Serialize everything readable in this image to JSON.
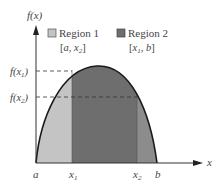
{
  "diagram": {
    "y_axis_label": "f(x)",
    "x_axis_label": "x",
    "legend": [
      {
        "name": "Region 1",
        "interval": "[a, x2]",
        "interval_display_a": "[",
        "interval_var1": "a",
        "interval_sep": ", ",
        "interval_var2": "x",
        "interval_sub2": "2",
        "interval_close": "]",
        "color": "#c0c0c0"
      },
      {
        "name": "Region 2",
        "interval": "[x1, b]",
        "interval_display_a": "[",
        "interval_var1": "x",
        "interval_sub1": "1",
        "interval_sep": ", ",
        "interval_var2": "b",
        "interval_close": "]",
        "color": "#6b6b6b"
      }
    ],
    "y_ticks": [
      {
        "label": "f(x1)",
        "base": "f(x",
        "sub": "1",
        "close": ")"
      },
      {
        "label": "f(x2)",
        "base": "f(x",
        "sub": "2",
        "close": ")"
      }
    ],
    "x_ticks": [
      {
        "label": "a",
        "base": "a"
      },
      {
        "label": "x1",
        "base": "x",
        "sub": "1"
      },
      {
        "label": "x2",
        "base": "x",
        "sub": "2"
      },
      {
        "label": "b",
        "base": "b"
      }
    ],
    "colors": {
      "region1": "#c4c4c4",
      "region2": "#6e6e6e",
      "overlap_tail": "#8a8a8a",
      "curve": "#1a1a1a",
      "axis": "#333333"
    }
  }
}
